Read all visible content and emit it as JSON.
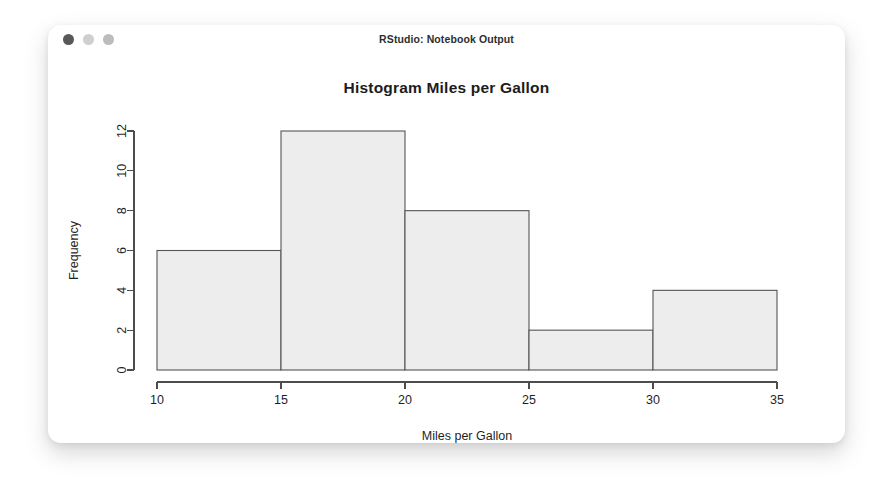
{
  "window": {
    "title": "RStudio: Notebook Output",
    "controls": [
      {
        "name": "close-button",
        "color": "#585858"
      },
      {
        "name": "minimize-button",
        "color": "#cfcfcf"
      },
      {
        "name": "maximize-button",
        "color": "#bcbcbc"
      }
    ]
  },
  "chart_data": {
    "type": "bar",
    "title": "Histogram Miles per Gallon",
    "xlabel": "Miles per Gallon",
    "ylabel": "Frequency",
    "categories": [
      "10-15",
      "15-20",
      "20-25",
      "25-30",
      "30-35"
    ],
    "bin_edges": [
      10,
      15,
      20,
      25,
      30,
      35
    ],
    "values": [
      6,
      12,
      8,
      2,
      4
    ],
    "xlim": [
      10,
      35
    ],
    "ylim": [
      0,
      12
    ],
    "xticks": [
      10,
      15,
      20,
      25,
      30,
      35
    ],
    "xtick_labels": [
      "10",
      "15",
      "20",
      "25",
      "30",
      "35"
    ],
    "yticks": [
      0,
      2,
      4,
      6,
      8,
      10,
      12
    ],
    "ytick_labels": [
      "0",
      "2",
      "4",
      "6",
      "8",
      "10",
      "12"
    ],
    "grid": false,
    "legend": false,
    "bar_fill": "#ededed",
    "bar_stroke": "#555555"
  }
}
